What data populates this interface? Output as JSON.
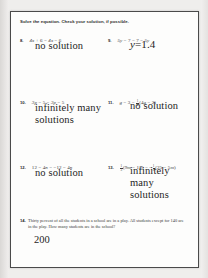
{
  "worksheet": {
    "directions": "Solve the equation. Check your solution, if possible.",
    "problems": [
      {
        "number": "8.",
        "equation_parts": [
          {
            "t": "var",
            "v": "4x"
          },
          {
            "t": "op",
            "v": " + 6 = "
          },
          {
            "t": "var",
            "v": "4x"
          },
          {
            "t": "op",
            "v": " − 6"
          }
        ],
        "equation_plain": "4x + 6 = 4x − 6",
        "answer": "no solution",
        "answer_type": "text",
        "answer_lines": [
          "no solution"
        ]
      },
      {
        "number": "9.",
        "equation_parts": [
          {
            "t": "var",
            "v": "5y"
          },
          {
            "t": "op",
            "v": " − 7 = 7 − "
          },
          {
            "t": "var",
            "v": "5y"
          }
        ],
        "equation_plain": "5y − 7 = 7 − 5y",
        "answer": "y = 1.4",
        "answer_type": "math",
        "answer_var": "y",
        "answer_eq": "=",
        "answer_val": "1.4"
      },
      {
        "number": "10.",
        "equation_parts": [
          {
            "t": "var",
            "v": "3p"
          },
          {
            "t": "op",
            "v": " − 5 = "
          },
          {
            "t": "var",
            "v": "3p"
          },
          {
            "t": "op",
            "v": " − 5"
          }
        ],
        "equation_plain": "3p − 5 = 3p − 5",
        "answer": "infinitely many solutions",
        "answer_type": "text",
        "answer_lines": [
          "infinitely many",
          "solutions"
        ]
      },
      {
        "number": "11.",
        "equation_parts": [
          {
            "t": "var",
            "v": "g"
          },
          {
            "t": "op",
            "v": " − 3 = "
          },
          {
            "t": "frac",
            "n": "1",
            "d": "4"
          },
          {
            "t": "op",
            "v": "(4"
          },
          {
            "t": "var",
            "v": "g"
          },
          {
            "t": "op",
            "v": " − 2)"
          }
        ],
        "equation_plain": "g − 3 = 1/4(4g − 2)",
        "answer": "no solution",
        "answer_type": "text",
        "answer_lines": [
          "no solution"
        ]
      },
      {
        "number": "12.",
        "equation_parts": [
          {
            "t": "op",
            "v": "12 − 4"
          },
          {
            "t": "var",
            "v": "n"
          },
          {
            "t": "op",
            "v": " = −12 − 4"
          },
          {
            "t": "var",
            "v": "n"
          }
        ],
        "equation_plain": "12 − 4n = −12 − 4n",
        "answer": "no solution",
        "answer_type": "text",
        "answer_lines": [
          "no solution"
        ]
      },
      {
        "number": "13.",
        "equation_parts": [
          {
            "t": "frac",
            "n": "1",
            "d": "3"
          },
          {
            "t": "op",
            "v": "(9"
          },
          {
            "t": "var",
            "v": "m"
          },
          {
            "t": "op",
            "v": " − 15) = −"
          },
          {
            "t": "frac",
            "n": "1",
            "d": "5"
          },
          {
            "t": "op",
            "v": "(25 − 5"
          },
          {
            "t": "var",
            "v": "m"
          },
          {
            "t": "op",
            "v": ")"
          }
        ],
        "equation_plain": "1/3(9m − 15) = −1/5(25 − 5m)",
        "answer": "infinitely many solutions",
        "answer_type": "text",
        "answer_lines": [
          "infinitely many",
          "solutions"
        ]
      }
    ],
    "word_problem": {
      "number": "14.",
      "text": "Thirty percent of all the students in a school are in a play. All students except for 140 are in the play. How many students are in the school?",
      "answer": "200"
    }
  }
}
